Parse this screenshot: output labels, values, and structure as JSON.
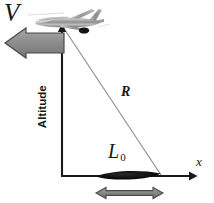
{
  "figure": {
    "background_color": "#ffffff"
  },
  "labels": {
    "velocity": "V",
    "range": "R",
    "x_axis": "x",
    "altitude": "Altitude",
    "footprint": "L",
    "footprint_subscript": "0"
  },
  "colors": {
    "axis": "#1a1a1a",
    "range_line": "#8e8e8e",
    "velocity_arrow_fill": "#8c8c8c",
    "velocity_arrow_stroke": "#4a4a4a",
    "footprint_arrow_fill": "#8a8a8a",
    "footprint_arrow_stroke": "#4a4a4a",
    "footprint_patch": "#0d0d0d",
    "aircraft": "#9a9a9a",
    "text": "#161616"
  },
  "geometry": {
    "origin": {
      "x": 62,
      "y": 176
    },
    "aircraft_point": {
      "x": 62,
      "y": 26
    },
    "footprint_far_edge": {
      "x": 161,
      "y": 176
    },
    "footprint_near_edge": {
      "x": 96,
      "y": 176
    },
    "x_axis_end": {
      "x": 196,
      "y": 176
    },
    "velocity_arrow": {
      "x1": 64,
      "y1": 43,
      "x2": 5,
      "y2": 43
    },
    "footprint_measure_arrow": {
      "x1": 96,
      "y1": 193,
      "x2": 163,
      "y2": 193
    }
  },
  "elements": {
    "aircraft_name": "airplane-icon",
    "velocity_arrow_name": "velocity-arrow",
    "range_line_name": "range-line",
    "altitude_axis_name": "altitude-axis",
    "x_axis_name": "x-axis",
    "footprint_patch_name": "footprint-patch",
    "footprint_arrow_name": "footprint-measure-arrow"
  }
}
